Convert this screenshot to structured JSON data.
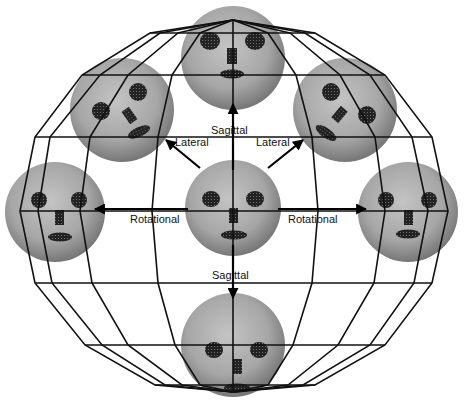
{
  "figure": {
    "background": "#ffffff",
    "line_color": "#111111",
    "head_color": "#a8a8a8",
    "feature_color": "#1a1a1a"
  },
  "labels": {
    "sagittal_up": "Sagittal",
    "sagittal_down": "Sagittal",
    "lateral_left": "Lateral",
    "lateral_right": "Lateral",
    "rotational_left": "Rotational",
    "rotational_right": "Rotational"
  },
  "heads": [
    {
      "id": "center",
      "cx": 233,
      "cy": 208,
      "r": 48,
      "pose": "frontal"
    },
    {
      "id": "top",
      "cx": 233,
      "cy": 58,
      "r": 52,
      "pose": "tilted-up"
    },
    {
      "id": "bottom",
      "cx": 233,
      "cy": 345,
      "r": 52,
      "pose": "tilted-down"
    },
    {
      "id": "left",
      "cx": 55,
      "cy": 212,
      "r": 50,
      "pose": "turned-left"
    },
    {
      "id": "right",
      "cx": 408,
      "cy": 212,
      "r": 50,
      "pose": "turned-right"
    },
    {
      "id": "upper-left",
      "cx": 122,
      "cy": 110,
      "r": 52,
      "pose": "tilted-left"
    },
    {
      "id": "upper-right",
      "cx": 345,
      "cy": 110,
      "r": 52,
      "pose": "tilted-right"
    }
  ]
}
